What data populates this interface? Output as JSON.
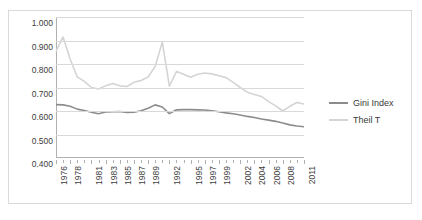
{
  "chart_data": {
    "type": "line",
    "title": "",
    "xlabel": "",
    "ylabel": "",
    "ylim": [
      0.4,
      1.0
    ],
    "yticks": [
      "0.400",
      "0.500",
      "0.600",
      "0.700",
      "0.800",
      "0.900",
      "1.000"
    ],
    "ytick_values": [
      0.4,
      0.5,
      0.6,
      0.7,
      0.8,
      0.9,
      1.0
    ],
    "grid": true,
    "legend_position": "right",
    "categories": [
      "1976",
      "1977",
      "1978",
      "1979",
      "1980",
      "1981",
      "1982",
      "1983",
      "1984",
      "1985",
      "1986",
      "1987",
      "1988",
      "1989",
      "1990",
      "1991",
      "1992",
      "1993",
      "1994",
      "1995",
      "1996",
      "1997",
      "1998",
      "1999",
      "2000",
      "2001",
      "2002",
      "2003",
      "2004",
      "2005",
      "2006",
      "2007",
      "2008",
      "2009",
      "2010",
      "2011"
    ],
    "xtick_labels": [
      "1976",
      "1978",
      "1981",
      "1983",
      "1985",
      "1987",
      "1989",
      "1992",
      "1995",
      "1997",
      "1999",
      "2002",
      "2004",
      "2006",
      "2008",
      "2011"
    ],
    "xtick_indices": [
      0,
      2,
      5,
      7,
      9,
      11,
      13,
      16,
      19,
      21,
      23,
      26,
      28,
      30,
      32,
      35
    ],
    "series": [
      {
        "name": "Gini Index",
        "color": "#8c8c8c",
        "values": [
          0.627,
          0.626,
          0.62,
          0.608,
          0.602,
          0.595,
          0.588,
          0.596,
          0.597,
          0.598,
          0.594,
          0.595,
          0.601,
          0.612,
          0.626,
          0.617,
          0.589,
          0.605,
          0.606,
          0.606,
          0.605,
          0.604,
          0.601,
          0.597,
          0.592,
          0.588,
          0.583,
          0.577,
          0.572,
          0.566,
          0.561,
          0.556,
          0.549,
          0.541,
          0.536,
          0.533
        ]
      },
      {
        "name": "Theil T",
        "color": "#d4d4d4",
        "values": [
          0.855,
          0.915,
          0.82,
          0.745,
          0.726,
          0.7,
          0.694,
          0.707,
          0.717,
          0.707,
          0.704,
          0.722,
          0.73,
          0.745,
          0.79,
          0.893,
          0.706,
          0.768,
          0.756,
          0.744,
          0.756,
          0.762,
          0.758,
          0.75,
          0.742,
          0.722,
          0.7,
          0.68,
          0.67,
          0.662,
          0.64,
          0.622,
          0.6,
          0.62,
          0.636,
          0.63
        ]
      }
    ]
  },
  "legend": {
    "items": [
      {
        "label": "Gini Index",
        "color": "#8c8c8c"
      },
      {
        "label": "Theil T",
        "color": "#d4d4d4"
      }
    ]
  }
}
